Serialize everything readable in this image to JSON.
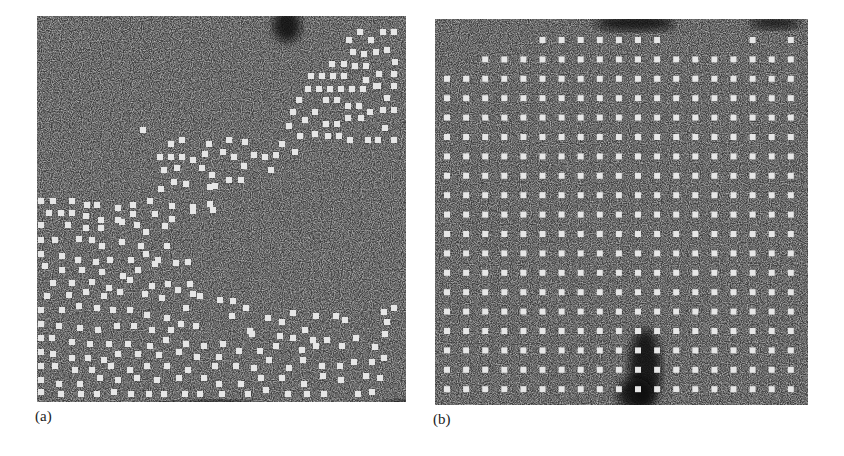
{
  "figure": {
    "panels": [
      {
        "id": "a",
        "label": "(a)",
        "box": {
          "x": 37,
          "y": 16,
          "w": 369,
          "h": 386
        },
        "background": "#3c3c3c",
        "dot_color": "#e6e6e6",
        "dot_size": 6,
        "dark_regions": [
          {
            "cx": 250,
            "cy": 10,
            "rx": 14,
            "ry": 16
          },
          {
            "cx": 390,
            "cy": 20,
            "rx": 12,
            "ry": 12
          },
          {
            "cx": 395,
            "cy": 190,
            "rx": 10,
            "ry": 10
          },
          {
            "cx": 180,
            "cy": 395,
            "rx": 40,
            "ry": 10
          },
          {
            "cx": 370,
            "cy": 395,
            "rx": 30,
            "ry": 10
          },
          {
            "cx": 130,
            "cy": 395,
            "rx": 20,
            "ry": 8
          }
        ],
        "dots": [
          [
            360,
            32
          ],
          [
            383,
            32
          ],
          [
            394,
            32
          ],
          [
            349,
            40
          ],
          [
            371,
            40
          ],
          [
            353,
            52
          ],
          [
            364,
            54
          ],
          [
            376,
            52
          ],
          [
            387,
            50
          ],
          [
            395,
            62
          ],
          [
            332,
            64
          ],
          [
            344,
            64
          ],
          [
            355,
            66
          ],
          [
            366,
            66
          ],
          [
            379,
            74
          ],
          [
            394,
            74
          ],
          [
            311,
            76
          ],
          [
            322,
            76
          ],
          [
            333,
            76
          ],
          [
            344,
            76
          ],
          [
            366,
            80
          ],
          [
            378,
            86
          ],
          [
            394,
            86
          ],
          [
            308,
            89
          ],
          [
            319,
            89
          ],
          [
            330,
            89
          ],
          [
            341,
            89
          ],
          [
            352,
            89
          ],
          [
            363,
            89
          ],
          [
            376,
            86
          ],
          [
            299,
            100
          ],
          [
            326,
            100
          ],
          [
            337,
            100
          ],
          [
            359,
            106
          ],
          [
            387,
            98
          ],
          [
            293,
            112
          ],
          [
            315,
            112
          ],
          [
            348,
            106
          ],
          [
            370,
            112
          ],
          [
            383,
            110
          ],
          [
            394,
            110
          ],
          [
            305,
            120
          ],
          [
            326,
            124
          ],
          [
            337,
            124
          ],
          [
            348,
            118
          ],
          [
            361,
            118
          ],
          [
            289,
            126
          ],
          [
            385,
            128
          ],
          [
            300,
            136
          ],
          [
            315,
            134
          ],
          [
            328,
            136
          ],
          [
            339,
            136
          ],
          [
            350,
            140
          ],
          [
            368,
            140
          ],
          [
            378,
            140
          ],
          [
            394,
            140
          ],
          [
            143,
            130
          ],
          [
            171,
            144
          ],
          [
            182,
            140
          ],
          [
            209,
            144
          ],
          [
            229,
            140
          ],
          [
            245,
            142
          ],
          [
            282,
            144
          ],
          [
            295,
            152
          ],
          [
            160,
            157
          ],
          [
            171,
            157
          ],
          [
            182,
            157
          ],
          [
            193,
            160
          ],
          [
            205,
            154
          ],
          [
            223,
            152
          ],
          [
            234,
            157
          ],
          [
            254,
            155
          ],
          [
            265,
            157
          ],
          [
            276,
            155
          ],
          [
            164,
            170
          ],
          [
            177,
            168
          ],
          [
            202,
            168
          ],
          [
            244,
            166
          ],
          [
            271,
            170
          ],
          [
            174,
            182
          ],
          [
            186,
            184
          ],
          [
            212,
            175
          ],
          [
            229,
            180
          ],
          [
            241,
            180
          ],
          [
            161,
            189
          ],
          [
            215,
            186
          ],
          [
            210,
            187
          ],
          [
            41,
            201
          ],
          [
            53,
            201
          ],
          [
            72,
            201
          ],
          [
            87,
            205
          ],
          [
            97,
            205
          ],
          [
            118,
            208
          ],
          [
            133,
            205
          ],
          [
            150,
            201
          ],
          [
            172,
            206
          ],
          [
            193,
            207
          ],
          [
            213,
            210
          ],
          [
            49,
            213
          ],
          [
            61,
            213
          ],
          [
            72,
            213
          ],
          [
            86,
            216
          ],
          [
            101,
            220
          ],
          [
            118,
            220
          ],
          [
            133,
            214
          ],
          [
            155,
            214
          ],
          [
            172,
            219
          ],
          [
            193,
            211
          ],
          [
            210,
            204
          ],
          [
            41,
            225
          ],
          [
            68,
            225
          ],
          [
            86,
            228
          ],
          [
            101,
            228
          ],
          [
            122,
            222
          ],
          [
            137,
            225
          ],
          [
            146,
            232
          ],
          [
            165,
            226
          ],
          [
            41,
            240
          ],
          [
            55,
            240
          ],
          [
            79,
            239
          ],
          [
            92,
            240
          ],
          [
            102,
            246
          ],
          [
            122,
            242
          ],
          [
            141,
            246
          ],
          [
            167,
            246
          ],
          [
            41,
            254
          ],
          [
            62,
            256
          ],
          [
            78,
            260
          ],
          [
            96,
            262
          ],
          [
            110,
            260
          ],
          [
            131,
            260
          ],
          [
            146,
            254
          ],
          [
            158,
            260
          ],
          [
            45,
            266
          ],
          [
            62,
            270
          ],
          [
            82,
            270
          ],
          [
            102,
            272
          ],
          [
            123,
            276
          ],
          [
            138,
            270
          ],
          [
            155,
            264
          ],
          [
            176,
            263
          ],
          [
            188,
            262
          ],
          [
            53,
            283
          ],
          [
            72,
            283
          ],
          [
            92,
            282
          ],
          [
            109,
            288
          ],
          [
            130,
            280
          ],
          [
            152,
            286
          ],
          [
            168,
            284
          ],
          [
            190,
            284
          ],
          [
            47,
            296
          ],
          [
            69,
            295
          ],
          [
            86,
            292
          ],
          [
            104,
            296
          ],
          [
            120,
            292
          ],
          [
            145,
            294
          ],
          [
            162,
            298
          ],
          [
            178,
            290
          ],
          [
            193,
            294
          ],
          [
            41,
            310
          ],
          [
            62,
            310
          ],
          [
            79,
            306
          ],
          [
            97,
            308
          ],
          [
            113,
            310
          ],
          [
            130,
            310
          ],
          [
            147,
            315
          ],
          [
            167,
            318
          ],
          [
            186,
            308
          ],
          [
            200,
            296
          ],
          [
            220,
            300
          ],
          [
            233,
            301
          ],
          [
            246,
            308
          ],
          [
            41,
            324
          ],
          [
            59,
            326
          ],
          [
            80,
            328
          ],
          [
            98,
            330
          ],
          [
            117,
            326
          ],
          [
            134,
            326
          ],
          [
            152,
            330
          ],
          [
            171,
            330
          ],
          [
            181,
            324
          ],
          [
            196,
            326
          ],
          [
            232,
            316
          ],
          [
            250,
            331
          ],
          [
            268,
            318
          ],
          [
            282,
            322
          ],
          [
            293,
            313
          ],
          [
            305,
            330
          ],
          [
            316,
            316
          ],
          [
            336,
            316
          ],
          [
            345,
            320
          ],
          [
            384,
            312
          ],
          [
            394,
            308
          ],
          [
            41,
            338
          ],
          [
            52,
            338
          ],
          [
            72,
            342
          ],
          [
            90,
            344
          ],
          [
            109,
            344
          ],
          [
            128,
            344
          ],
          [
            150,
            346
          ],
          [
            166,
            340
          ],
          [
            186,
            344
          ],
          [
            204,
            346
          ],
          [
            223,
            344
          ],
          [
            252,
            334
          ],
          [
            280,
            336
          ],
          [
            293,
            338
          ],
          [
            313,
            340
          ],
          [
            327,
            340
          ],
          [
            387,
            322
          ],
          [
            41,
            352
          ],
          [
            53,
            354
          ],
          [
            72,
            358
          ],
          [
            88,
            358
          ],
          [
            104,
            360
          ],
          [
            118,
            354
          ],
          [
            138,
            354
          ],
          [
            159,
            355
          ],
          [
            179,
            352
          ],
          [
            197,
            357
          ],
          [
            219,
            357
          ],
          [
            239,
            351
          ],
          [
            260,
            351
          ],
          [
            276,
            346
          ],
          [
            302,
            350
          ],
          [
            316,
            346
          ],
          [
            342,
            346
          ],
          [
            356,
            338
          ],
          [
            375,
            347
          ],
          [
            385,
            334
          ],
          [
            41,
            366
          ],
          [
            55,
            366
          ],
          [
            75,
            370
          ],
          [
            92,
            370
          ],
          [
            111,
            366
          ],
          [
            130,
            370
          ],
          [
            147,
            366
          ],
          [
            167,
            366
          ],
          [
            188,
            370
          ],
          [
            215,
            366
          ],
          [
            236,
            366
          ],
          [
            254,
            368
          ],
          [
            269,
            360
          ],
          [
            289,
            368
          ],
          [
            303,
            360
          ],
          [
            322,
            366
          ],
          [
            340,
            366
          ],
          [
            354,
            362
          ],
          [
            372,
            362
          ],
          [
            384,
            358
          ],
          [
            41,
            380
          ],
          [
            59,
            384
          ],
          [
            80,
            384
          ],
          [
            100,
            378
          ],
          [
            118,
            380
          ],
          [
            137,
            378
          ],
          [
            157,
            380
          ],
          [
            179,
            378
          ],
          [
            204,
            378
          ],
          [
            219,
            384
          ],
          [
            241,
            384
          ],
          [
            261,
            378
          ],
          [
            282,
            378
          ],
          [
            304,
            384
          ],
          [
            323,
            376
          ],
          [
            341,
            380
          ],
          [
            366,
            376
          ],
          [
            380,
            378
          ],
          [
            41,
            392
          ],
          [
            61,
            394
          ],
          [
            81,
            394
          ],
          [
            97,
            394
          ],
          [
            114,
            392
          ],
          [
            131,
            394
          ],
          [
            149,
            394
          ],
          [
            164,
            394
          ],
          [
            185,
            394
          ],
          [
            200,
            394
          ],
          [
            222,
            394
          ],
          [
            248,
            394
          ],
          [
            266,
            390
          ],
          [
            288,
            394
          ],
          [
            307,
            394
          ],
          [
            324,
            394
          ],
          [
            358,
            394
          ],
          [
            372,
            392
          ]
        ]
      },
      {
        "id": "b",
        "label": "(b)",
        "box": {
          "x": 435,
          "y": 19,
          "w": 373,
          "h": 386
        },
        "background": "#3a3a3a",
        "dot_color": "#e6e6e6",
        "dot_size": 6,
        "dark_regions": [
          {
            "cx": 200,
            "cy": 4,
            "rx": 40,
            "ry": 8
          },
          {
            "cx": 210,
            "cy": 350,
            "rx": 16,
            "ry": 40
          },
          {
            "cx": 200,
            "cy": 375,
            "rx": 18,
            "ry": 16
          },
          {
            "cx": 340,
            "cy": 4,
            "rx": 25,
            "ry": 6
          }
        ],
        "grid": {
          "origin_x": 12,
          "origin_y": 21,
          "pitch_x": 19.1,
          "pitch_y": 19.4,
          "cols": 19,
          "rows": 19,
          "missing": [
            [
              0,
              0
            ],
            [
              0,
              1
            ],
            [
              0,
              2
            ],
            [
              0,
              3
            ],
            [
              0,
              4
            ],
            [
              0,
              12
            ],
            [
              0,
              13
            ],
            [
              0,
              14
            ],
            [
              0,
              15
            ],
            [
              0,
              17
            ],
            [
              1,
              0
            ],
            [
              1,
              1
            ]
          ]
        }
      }
    ]
  }
}
